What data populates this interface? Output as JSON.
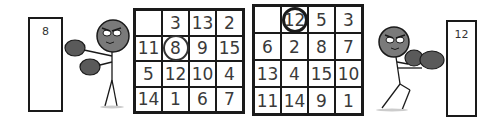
{
  "left_panel": {
    "board_number": "8",
    "grid": [
      [
        "",
        "3",
        "13",
        "2"
      ],
      [
        "11",
        "8",
        "9",
        "15"
      ],
      [
        "5",
        "12",
        "10",
        "4"
      ],
      [
        "14",
        "1",
        "6",
        "7"
      ]
    ],
    "circled_value": "8"
  },
  "right_panel": {
    "board_number": "12",
    "grid": [
      [
        "",
        "12",
        "5",
        "3"
      ],
      [
        "6",
        "2",
        "8",
        "7"
      ],
      [
        "13",
        "4",
        "15",
        "10"
      ],
      [
        "11",
        "14",
        "9",
        "1"
      ]
    ],
    "circled_value": "12"
  },
  "colors": {
    "ink": "#1a1a1a",
    "head": "#7a7a7a",
    "glove": "#5a5a5a",
    "background": "#ffffff"
  }
}
